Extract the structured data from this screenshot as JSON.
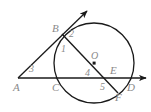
{
  "figure": {
    "type": "geometry-diagram",
    "canvas": {
      "width": 151,
      "height": 112,
      "background": "#ffffff"
    },
    "stroke_color": "#1a1a1a",
    "label_color": "#8a8a8a",
    "circle": {
      "cx": 94,
      "cy": 63,
      "r": 40,
      "center_label": "O"
    },
    "points": [
      {
        "name": "A",
        "label": "A",
        "x": 18,
        "y": 78,
        "label_x": 13,
        "label_y": 82
      },
      {
        "name": "B",
        "label": "B",
        "x": 62,
        "y": 34,
        "label_x": 52,
        "label_y": 23
      },
      {
        "name": "C",
        "label": "C",
        "x": 58,
        "y": 78,
        "label_x": 52,
        "label_y": 82
      },
      {
        "name": "D",
        "label": "D",
        "x": 140,
        "y": 78,
        "label_x": 127,
        "label_y": 82
      },
      {
        "name": "E",
        "label": "E",
        "x": 112,
        "y": 78,
        "label_x": 110,
        "label_y": 65
      },
      {
        "name": "F",
        "label": "F",
        "x": 117,
        "y": 92,
        "label_x": 115,
        "label_y": 92
      },
      {
        "name": "O",
        "label": "O",
        "x": 94,
        "y": 63,
        "label_x": 91,
        "label_y": 51
      }
    ],
    "angles": [
      {
        "name": "angle-1",
        "label": "1",
        "x": 61,
        "y": 44
      },
      {
        "name": "angle-2",
        "label": "2",
        "x": 69,
        "y": 29
      },
      {
        "name": "angle-3",
        "label": "3",
        "x": 29,
        "y": 64
      },
      {
        "name": "angle-4",
        "label": "4",
        "x": 85,
        "y": 68
      },
      {
        "name": "angle-5",
        "label": "5",
        "x": 100,
        "y": 82
      }
    ],
    "lines": [
      {
        "name": "tangent-ray-AB",
        "from": "A",
        "through": "B",
        "to_arrow_x": 89,
        "to_arrow_y": 9
      },
      {
        "name": "secant-line-AD",
        "from": "A",
        "to_arrow_x": 149,
        "to_arrow_y": 78
      },
      {
        "name": "diameter-BF",
        "from": "B",
        "to": "F"
      }
    ]
  }
}
